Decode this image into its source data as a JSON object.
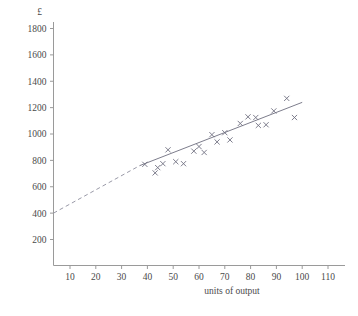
{
  "chart_data": {
    "type": "scatter",
    "title": "",
    "xlabel": "units of output",
    "ylabel": "£",
    "ylabel_symbol": "£",
    "xlim": [
      0,
      115
    ],
    "ylim": [
      0,
      1900
    ],
    "xticks": [
      10,
      20,
      30,
      40,
      50,
      60,
      70,
      80,
      90,
      100,
      110
    ],
    "yticks": [
      200,
      400,
      600,
      800,
      1000,
      1200,
      1400,
      1600,
      1800
    ],
    "xtick_labels": [
      "10",
      "20",
      "30",
      "40",
      "50",
      "60",
      "70",
      "80",
      "90",
      "100",
      "110"
    ],
    "ytick_labels": [
      "200",
      "400",
      "600",
      "800",
      "1000",
      "1200",
      "1400",
      "1600",
      "1800"
    ],
    "grid": false,
    "legend": null,
    "marker_style": "x",
    "marker_color": "#6f6f80",
    "line_color": "#7d7d8c",
    "points": [
      {
        "x": 39,
        "y": 770
      },
      {
        "x": 43,
        "y": 705
      },
      {
        "x": 44,
        "y": 745
      },
      {
        "x": 46,
        "y": 775
      },
      {
        "x": 48,
        "y": 880
      },
      {
        "x": 51,
        "y": 790
      },
      {
        "x": 54,
        "y": 775
      },
      {
        "x": 58,
        "y": 870
      },
      {
        "x": 60,
        "y": 905
      },
      {
        "x": 62,
        "y": 860
      },
      {
        "x": 65,
        "y": 995
      },
      {
        "x": 67,
        "y": 940
      },
      {
        "x": 70,
        "y": 1010
      },
      {
        "x": 72,
        "y": 955
      },
      {
        "x": 76,
        "y": 1080
      },
      {
        "x": 79,
        "y": 1130
      },
      {
        "x": 82,
        "y": 1125
      },
      {
        "x": 83,
        "y": 1065
      },
      {
        "x": 86,
        "y": 1070
      },
      {
        "x": 89,
        "y": 1175
      },
      {
        "x": 94,
        "y": 1270
      },
      {
        "x": 97,
        "y": 1125
      }
    ],
    "fit_line": {
      "style_solid": "solid",
      "style_extrapolated": "dashed",
      "intercept_at_zero": 400,
      "solid_from_x": 37,
      "solid_to_x": 100,
      "solid_from_y": 760,
      "solid_to_y": 1240,
      "dashed_from_x": 0,
      "dashed_to_x": 37,
      "dashed_from_y": 400,
      "dashed_to_y": 760
    }
  }
}
